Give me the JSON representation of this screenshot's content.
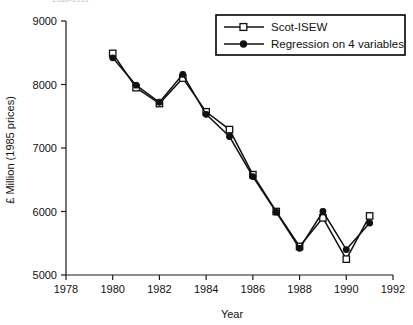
{
  "figure": {
    "partial_top_caption": "1980-1991",
    "background_color": "#ffffff",
    "ink_color": "#111111"
  },
  "legend": {
    "position": "top-right",
    "entries": [
      {
        "label": "Scot-ISEW",
        "marker": "open-square-marker",
        "color": "#111111"
      },
      {
        "label": "Regression on 4 variables",
        "marker": "filled-circle-marker",
        "color": "#111111"
      }
    ]
  },
  "axes": {
    "x": {
      "title": "Year",
      "ticks": [
        "1978",
        "1980",
        "1982",
        "1984",
        "1986",
        "1988",
        "1990",
        "1992"
      ],
      "min": 1978,
      "max": 1992,
      "step": 2
    },
    "y": {
      "title": "£ Million (1985 prices)",
      "ticks": [
        "5000",
        "6000",
        "7000",
        "8000",
        "9000"
      ],
      "min": 5000,
      "max": 9000,
      "step": 1000
    }
  },
  "chart_data": {
    "type": "line",
    "title": "",
    "subtitle": "",
    "xlabel": "Year",
    "ylabel": "£ Million (1985 prices)",
    "xlim": [
      1978,
      1992
    ],
    "ylim": [
      5000,
      9000
    ],
    "grid": false,
    "legend_position": "top-right",
    "x": [
      1980,
      1981,
      1982,
      1983,
      1984,
      1985,
      1986,
      1987,
      1988,
      1989,
      1990,
      1991
    ],
    "series": [
      {
        "name": "Scot-ISEW",
        "marker": "open-square",
        "values": [
          8490,
          7950,
          7700,
          8100,
          7570,
          7290,
          6580,
          6000,
          5450,
          5900,
          5250,
          5930
        ]
      },
      {
        "name": "Regression on 4 variables",
        "marker": "filled-circle",
        "values": [
          8420,
          7990,
          7720,
          8160,
          7530,
          7180,
          6550,
          5990,
          5420,
          6000,
          5400,
          5820
        ]
      }
    ]
  }
}
